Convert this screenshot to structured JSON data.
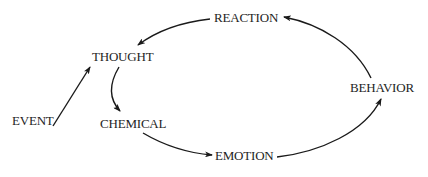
{
  "diagram": {
    "type": "cycle-flow",
    "colors": {
      "background": "#ffffff",
      "text": "#1e1e1e",
      "stroke": "#1a1a1a"
    },
    "nodes": {
      "reaction": "REACTION",
      "thought": "THOUGHT",
      "event": "EVENT",
      "chemical": "CHEMICAL",
      "emotion": "EMOTION",
      "behavior": "BEHAVIOR"
    },
    "edges": [
      {
        "from": "EVENT",
        "to": "THOUGHT"
      },
      {
        "from": "THOUGHT",
        "to": "CHEMICAL"
      },
      {
        "from": "CHEMICAL",
        "to": "EMOTION"
      },
      {
        "from": "EMOTION",
        "to": "BEHAVIOR"
      },
      {
        "from": "BEHAVIOR",
        "to": "REACTION"
      },
      {
        "from": "REACTION",
        "to": "THOUGHT"
      }
    ]
  }
}
